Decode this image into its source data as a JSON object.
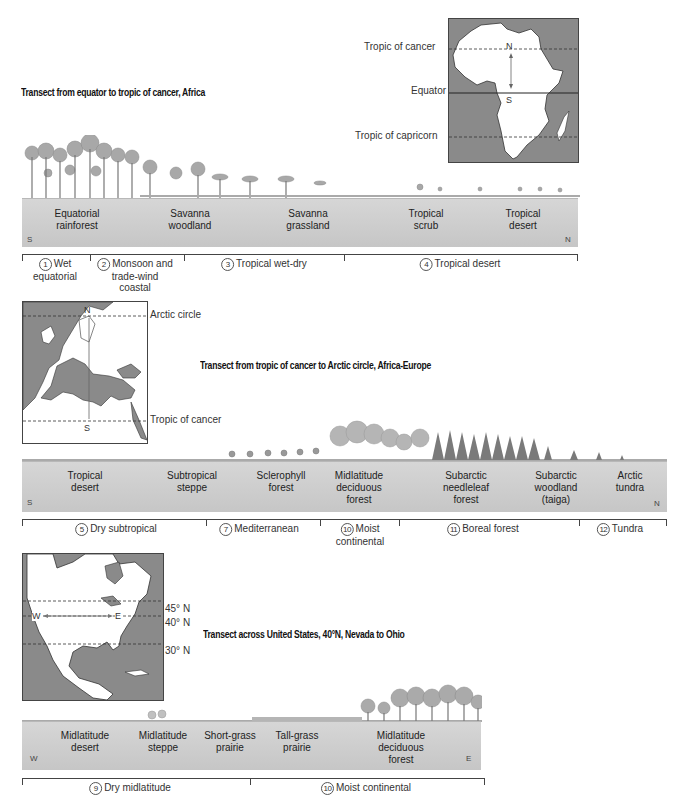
{
  "transects": [
    {
      "title": "Transect from equator to tropic of cancer, Africa",
      "map": {
        "region": "Africa",
        "labels": [
          "Tropic of cancer",
          "Equator",
          "Tropic of capricorn"
        ],
        "markers": {
          "north": "N",
          "south": "S"
        }
      },
      "direction": {
        "start": "S",
        "end": "N"
      },
      "vegetation_zones": [
        {
          "line1": "Equatorial",
          "line2": "rainforest"
        },
        {
          "line1": "Savanna",
          "line2": "woodland"
        },
        {
          "line1": "Savanna",
          "line2": "grassland"
        },
        {
          "line1": "Tropical",
          "line2": "scrub"
        },
        {
          "line1": "Tropical",
          "line2": "desert"
        }
      ],
      "climates": [
        {
          "number": "1",
          "line1": "Wet",
          "line2": "equatorial"
        },
        {
          "number": "2",
          "line1": "Monsoon and",
          "line2": "trade-wind",
          "line3": "coastal"
        },
        {
          "number": "3",
          "line1": "Tropical wet-dry"
        },
        {
          "number": "4",
          "line1": "Tropical desert"
        }
      ]
    },
    {
      "title": "Transect from tropic of cancer to Arctic circle, Africa-Europe",
      "map": {
        "region": "Europe and North Africa",
        "labels": [
          "Arctic circle",
          "Tropic of cancer"
        ],
        "markers": {
          "north": "N",
          "south": "S"
        }
      },
      "direction": {
        "start": "S",
        "end": "N"
      },
      "vegetation_zones": [
        {
          "line1": "Tropical",
          "line2": "desert"
        },
        {
          "line1": "Subtropical",
          "line2": "steppe"
        },
        {
          "line1": "Sclerophyll",
          "line2": "forest"
        },
        {
          "line1": "Midlatitude",
          "line2": "deciduous",
          "line3": "forest"
        },
        {
          "line1": "Subarctic",
          "line2": "needleleaf",
          "line3": "forest"
        },
        {
          "line1": "Subarctic",
          "line2": "woodland",
          "line3": "(taiga)"
        },
        {
          "line1": "Arctic",
          "line2": "tundra"
        }
      ],
      "climates": [
        {
          "number": "5",
          "line1": "Dry subtropical"
        },
        {
          "number": "7",
          "line1": "Mediterranean"
        },
        {
          "number": "10",
          "line1": "Moist",
          "line2": "continental"
        },
        {
          "number": "11",
          "line1": "Boreal forest"
        },
        {
          "number": "12",
          "line1": "Tundra"
        }
      ]
    },
    {
      "title": "Transect across United States, 40°N, Nevada to Ohio",
      "map": {
        "region": "North America",
        "labels": [
          "45° N",
          "40° N",
          "30° N"
        ],
        "markers": {
          "west": "W",
          "east": "E"
        }
      },
      "direction": {
        "start": "W",
        "end": "E"
      },
      "vegetation_zones": [
        {
          "line1": "Midlatitude",
          "line2": "desert"
        },
        {
          "line1": "Midlatitude",
          "line2": "steppe"
        },
        {
          "line1": "Short-grass",
          "line2": "prairie"
        },
        {
          "line1": "Tall-grass",
          "line2": "prairie"
        },
        {
          "line1": "Midlatitude",
          "line2": "deciduous",
          "line3": "forest"
        }
      ],
      "climates": [
        {
          "number": "9",
          "line1": "Dry midlatitude"
        },
        {
          "number": "10",
          "line1": "Moist continental"
        }
      ]
    }
  ],
  "colors": {
    "ground": "#c9c9c9",
    "ocean": "#8a8a8a",
    "land": "#ffffff",
    "foliage": "#a9a9a9",
    "conifer": "#777777"
  }
}
